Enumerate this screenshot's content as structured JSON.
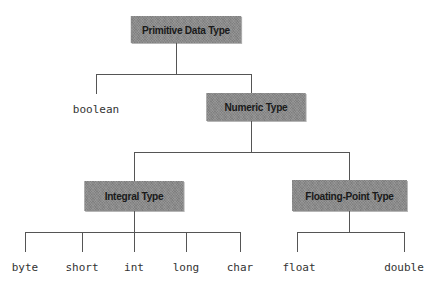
{
  "diagram": {
    "nodes": {
      "root": {
        "label": "Primitive Data Type"
      },
      "numeric": {
        "label": "Numeric Type"
      },
      "integral": {
        "label": "Integral Type"
      },
      "floating": {
        "label": "Floating-Point Type"
      }
    },
    "leaves": {
      "boolean": "boolean",
      "byte": "byte",
      "short": "short",
      "int": "int",
      "long": "long",
      "char": "char",
      "float": "float",
      "double": "double"
    },
    "edges": [
      [
        "Primitive Data Type",
        "boolean"
      ],
      [
        "Primitive Data Type",
        "Numeric Type"
      ],
      [
        "Numeric Type",
        "Integral Type"
      ],
      [
        "Numeric Type",
        "Floating-Point Type"
      ],
      [
        "Integral Type",
        "byte"
      ],
      [
        "Integral Type",
        "short"
      ],
      [
        "Integral Type",
        "int"
      ],
      [
        "Integral Type",
        "long"
      ],
      [
        "Integral Type",
        "char"
      ],
      [
        "Floating-Point Type",
        "float"
      ],
      [
        "Floating-Point Type",
        "double"
      ]
    ],
    "colors": {
      "box_fill": "#8a8a8a",
      "line": "#555555",
      "text": "#1a1a1a"
    }
  }
}
